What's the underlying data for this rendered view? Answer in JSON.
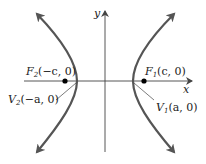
{
  "diagram": {
    "type": "hyperbola",
    "axes": {
      "x_label": "x",
      "y_label": "y"
    },
    "foci": [
      {
        "name": "F1",
        "label_main": "F",
        "label_sub": "1",
        "label_rest": "(c, 0)"
      },
      {
        "name": "F2",
        "label_main": "F",
        "label_sub": "2",
        "label_rest": "(−c, 0)"
      }
    ],
    "vertices": [
      {
        "name": "V1",
        "label_main": "V",
        "label_sub": "1",
        "label_rest": "(a, 0)"
      },
      {
        "name": "V2",
        "label_main": "V",
        "label_sub": "2",
        "label_rest": "(−a, 0)"
      }
    ],
    "colors": {
      "curve": "#555555",
      "axis": "#444444",
      "point": "#000000"
    }
  }
}
